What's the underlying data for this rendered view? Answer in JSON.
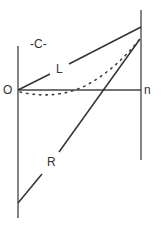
{
  "diagram": {
    "labels": {
      "c": "-C-",
      "l": "L",
      "r": "R",
      "origin": "O",
      "n": "n"
    },
    "colors": {
      "line": "#333333",
      "background": "#ffffff"
    }
  }
}
